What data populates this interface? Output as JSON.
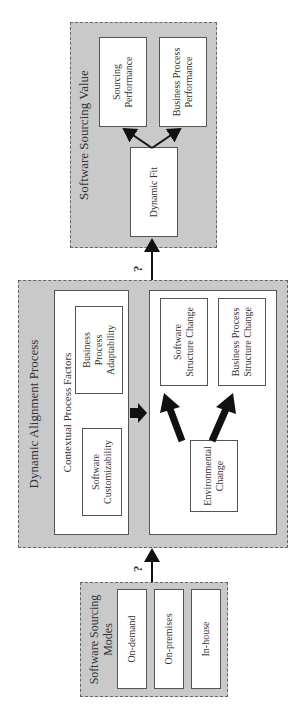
{
  "diagram": {
    "orientation": "rotated 90 degrees counter-clockwise",
    "groups": {
      "modes": {
        "title": "Software Sourcing Modes",
        "items": [
          "On-demand",
          "On-premises",
          "In-house"
        ]
      },
      "alignment": {
        "title": "Dynamic Alignment Process",
        "contextual": {
          "title": "Contextual Process Factors",
          "items": [
            "Software Customizability",
            "Business Process Adaptability"
          ]
        },
        "change": {
          "source": "Environmental Change",
          "targets": [
            "Software Structure Change",
            "Business Process Structure Change"
          ]
        }
      },
      "value": {
        "title": "Software Sourcing Value",
        "source": "Dynamic Fit",
        "targets": [
          "Sourcing Performance",
          "Business Process Performance"
        ]
      }
    },
    "connectors": [
      {
        "from": "Software Sourcing Modes",
        "to": "Dynamic Alignment Process",
        "label": "?"
      },
      {
        "from": "Dynamic Alignment Process",
        "to": "Dynamic Fit",
        "label": "?"
      }
    ],
    "colors": {
      "group_fill": "#c9c9c9",
      "box_fill": "#ffffff",
      "border": "#555555",
      "arrow": "#111111"
    }
  }
}
